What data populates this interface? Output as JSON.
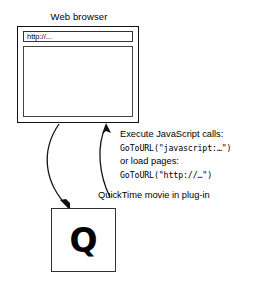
{
  "diagram": {
    "browser": {
      "title": "Web browser",
      "url_value": "http://...",
      "url_placeholder": "http://..."
    },
    "callout": {
      "lines": [
        "Execute JavaScript calls:",
        "GoToURL(\"javascript:…\")",
        "or load pages:",
        "GoToURL(\"http://…\")"
      ]
    },
    "plugin": {
      "caption": "QuickTime movie in plug-in",
      "glyph": "Q"
    },
    "colors": {
      "stroke": "#111111",
      "background": "#ffffff",
      "text": "#000000"
    }
  }
}
